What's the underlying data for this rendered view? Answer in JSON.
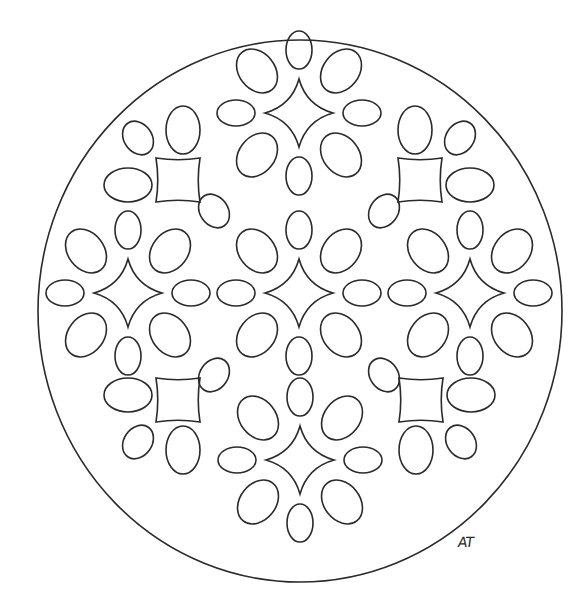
{
  "artwork": {
    "title": "Mandala coloring page",
    "signature": "AT",
    "line_color": "#2a2a2a",
    "background_color": "#ffffff",
    "flowers": [
      {
        "name": "center",
        "petals": 8
      },
      {
        "name": "top",
        "petals": 8
      },
      {
        "name": "bottom",
        "petals": 8
      },
      {
        "name": "left",
        "petals": 8
      },
      {
        "name": "right",
        "petals": 8
      }
    ],
    "corner_squares": [
      "top-left",
      "top-right",
      "bottom-left",
      "bottom-right"
    ]
  }
}
